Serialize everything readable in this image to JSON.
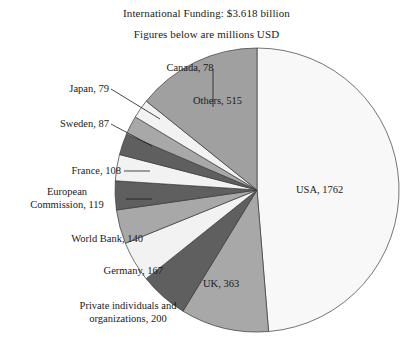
{
  "title": {
    "line1": "International Funding: $3.618 billion",
    "line2": "Figures below are millions USD"
  },
  "chart_data": {
    "type": "pie",
    "title": "International Funding: $3.618 billion",
    "subtitle": "Figures below are millions USD",
    "unit": "millions USD",
    "total": 3618,
    "categories": [
      "USA",
      "UK",
      "Private individuals and organizations",
      "Germany",
      "World Bank",
      "European Commission",
      "France",
      "Sweden",
      "Japan",
      "Canada",
      "Others"
    ],
    "values": [
      1762,
      363,
      200,
      167,
      140,
      119,
      108,
      87,
      79,
      78,
      515
    ],
    "labels": [
      "USA, 1762",
      "UK, 363",
      "Private individuals and organizations, 200",
      "Germany, 167",
      "World Bank, 140",
      "European Commission, 119",
      "France, 108",
      "Sweden, 87",
      "Japan, 79",
      "Canada, 78",
      "Others, 515"
    ],
    "colors": [
      "#f8f8f8",
      "#a8a8a8",
      "#5f5f5f",
      "#f2f2f2",
      "#a8a8a8",
      "#5f5f5f",
      "#f2f2f2",
      "#5f5f5f",
      "#a8a8a8",
      "#f2f2f2",
      "#a0a0a0"
    ],
    "start_angle_deg": 0,
    "direction": "clockwise",
    "legend": "none",
    "grid": false
  },
  "slice_labels": {
    "usa": "USA, 1762",
    "uk": "UK, 363",
    "others": "Others, 515"
  },
  "callouts": {
    "canada": "Canada, 78",
    "japan": "Japan, 79",
    "sweden": "Sweden, 87",
    "france": "France, 108",
    "european_commission_line1": "European",
    "european_commission_line2": "Commission, 119",
    "world_bank": "World Bank, 140",
    "germany": "Germany, 167",
    "private_line1": "Private individuals and",
    "private_line2": "organizations, 200"
  }
}
